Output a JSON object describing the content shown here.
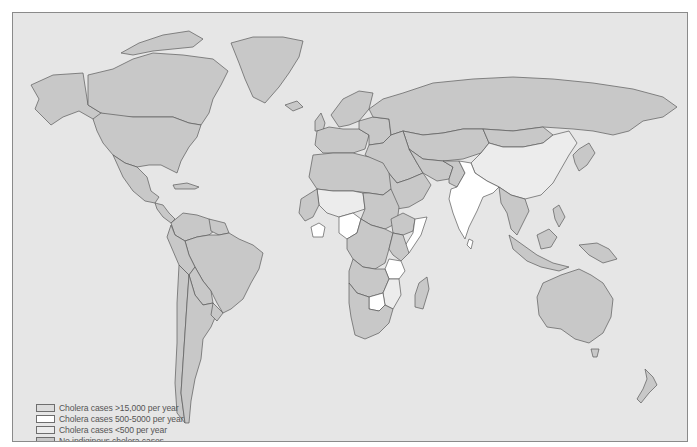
{
  "map": {
    "colors": {
      "ocean": "#e6e6e6",
      "high": "#dcdcdc",
      "mid": "#ffffff",
      "low": "#ececec",
      "none": "#c8c8c8",
      "outline": "#5a5a5a",
      "frame": "#8a8a8a"
    },
    "regions": [
      {
        "name": "alaska",
        "cls": "none",
        "d": "M18,72 L40,62 L70,60 L75,92 L88,100 L92,110 L80,106 L66,98 L50,104 L38,112 L30,104 L22,96 L26,86 Z"
      },
      {
        "name": "canada",
        "cls": "none",
        "d": "M75,92 L75,62 L100,56 L120,46 L140,40 L170,42 L200,46 L215,58 L208,72 L200,86 L196,100 L188,112 L176,110 L160,104 L120,104 L100,104 L88,100 Z"
      },
      {
        "name": "canada-arctic-islands",
        "cls": "none",
        "d": "M108,40 L126,30 L150,22 L176,18 L190,26 L180,34 L160,36 L140,38 L120,42 Z"
      },
      {
        "name": "greenland",
        "cls": "none",
        "d": "M218,30 L240,24 L270,24 L290,28 L286,44 L276,60 L266,74 L252,90 L240,84 L232,66 L226,50 Z"
      },
      {
        "name": "usa",
        "cls": "none",
        "d": "M80,106 L88,100 L120,104 L160,104 L176,110 L188,112 L184,124 L176,134 L168,148 L164,160 L156,156 L148,152 L136,152 L124,154 L112,150 L100,142 L90,130 L84,118 Z"
      },
      {
        "name": "mexico",
        "cls": "none",
        "d": "M100,142 L112,150 L124,154 L134,164 L138,178 L146,184 L142,190 L132,188 L120,178 L110,164 Z"
      },
      {
        "name": "central-america",
        "cls": "none",
        "d": "M142,190 L150,192 L156,200 L162,206 L158,210 L150,204 L144,196 Z"
      },
      {
        "name": "caribbean",
        "cls": "none",
        "d": "M160,172 L174,170 L186,174 L182,176 L170,176 L162,176 Z"
      },
      {
        "name": "colombia-venezuela",
        "cls": "none",
        "d": "M158,210 L170,200 L184,202 L196,206 L206,214 L196,222 L184,224 L172,228 L162,222 Z"
      },
      {
        "name": "guianas",
        "cls": "none",
        "d": "M196,206 L212,210 L216,220 L206,222 L198,218 Z"
      },
      {
        "name": "brazil",
        "cls": "none",
        "d": "M172,228 L184,224 L196,222 L206,222 L216,220 L226,226 L240,232 L250,240 L246,256 L238,270 L230,286 L218,296 L210,300 L204,290 L198,278 L190,268 L182,254 L176,242 Z"
      },
      {
        "name": "peru-ecuador",
        "cls": "none",
        "d": "M158,212 L162,222 L172,228 L176,242 L182,254 L176,262 L166,252 L160,238 L154,224 Z"
      },
      {
        "name": "bolivia-paraguay",
        "cls": "none",
        "d": "M176,262 L182,254 L190,268 L198,278 L200,290 L190,292 L182,282 Z"
      },
      {
        "name": "chile",
        "cls": "none",
        "d": "M166,252 L176,262 L174,290 L172,320 L170,350 L168,380 L172,410 L164,400 L162,370 L164,330 L164,290 Z"
      },
      {
        "name": "argentina",
        "cls": "none",
        "d": "M176,262 L182,282 L190,292 L200,290 L204,300 L198,314 L190,326 L188,346 L182,366 L178,388 L176,410 L172,410 L168,380 L170,350 L172,320 L174,290 Z"
      },
      {
        "name": "uruguay",
        "cls": "none",
        "d": "M200,290 L210,300 L204,308 L198,302 Z"
      },
      {
        "name": "iceland",
        "cls": "none",
        "d": "M272,92 L284,88 L290,94 L280,98 Z"
      },
      {
        "name": "uk",
        "cls": "none",
        "d": "M302,108 L308,100 L312,110 L310,118 L302,118 Z"
      },
      {
        "name": "scandinavia",
        "cls": "none",
        "d": "M318,102 L330,86 L346,78 L360,80 L356,96 L346,108 L336,112 L326,114 Z"
      },
      {
        "name": "western-europe",
        "cls": "none",
        "d": "M304,118 L316,114 L330,116 L346,116 L356,122 L352,136 L340,140 L326,140 L310,140 L302,132 Z"
      },
      {
        "name": "eastern-europe",
        "cls": "none",
        "d": "M346,108 L360,104 L376,106 L378,122 L370,130 L356,132 L356,122 L346,116 Z"
      },
      {
        "name": "russia",
        "cls": "none",
        "d": "M356,96 L370,86 L390,80 L420,70 L460,66 L500,64 L540,66 L580,70 L620,76 L650,84 L664,94 L650,104 L630,108 L616,118 L600,122 L580,118 L560,116 L530,114 L500,118 L470,116 L450,116 L430,120 L410,122 L390,118 L378,122 L376,106 L360,104 Z"
      },
      {
        "name": "kazakhstan-central-asia",
        "cls": "none",
        "d": "M390,118 L410,122 L430,120 L450,116 L470,116 L476,130 L468,140 L450,146 L430,148 L410,146 L396,136 Z"
      },
      {
        "name": "mongolia",
        "cls": "none",
        "d": "M470,116 L500,118 L530,114 L540,122 L530,130 L510,134 L490,134 L476,130 Z"
      },
      {
        "name": "china",
        "cls": "low",
        "d": "M468,140 L476,130 L490,134 L510,134 L530,130 L540,122 L556,118 L564,130 L556,142 L548,156 L540,170 L528,182 L512,186 L498,182 L486,174 L474,168 L462,160 L458,150 Z"
      },
      {
        "name": "korea-japan",
        "cls": "none",
        "d": "M560,142 L566,136 L576,130 L582,140 L574,152 L566,158 L562,150 Z"
      },
      {
        "name": "turkey-middle-east",
        "cls": "none",
        "d": "M356,132 L370,130 L378,122 L390,118 L396,136 L404,150 L410,160 L396,166 L384,170 L374,158 L362,148 L352,142 Z"
      },
      {
        "name": "iran-afghanistan",
        "cls": "none",
        "d": "M396,136 L410,146 L430,148 L440,154 L436,166 L424,168 L410,160 L404,150 Z"
      },
      {
        "name": "pakistan",
        "cls": "none",
        "d": "M430,148 L446,148 L452,160 L444,174 L436,170 L436,166 L440,154 Z"
      },
      {
        "name": "arabia",
        "cls": "none",
        "d": "M374,158 L384,170 L396,166 L410,160 L418,172 L410,186 L396,194 L384,196 L376,182 Z"
      },
      {
        "name": "india",
        "cls": "mid",
        "d": "M446,148 L458,150 L462,160 L474,168 L486,174 L480,180 L470,184 L464,198 L456,214 L452,226 L446,216 L440,200 L436,186 L438,176 L444,174 L452,160 Z"
      },
      {
        "name": "sri-lanka",
        "cls": "mid",
        "d": "M456,226 L460,228 L458,236 L454,232 Z"
      },
      {
        "name": "southeast-asia",
        "cls": "none",
        "d": "M486,174 L498,182 L512,186 L516,198 L510,210 L504,222 L498,216 L494,200 L488,190 Z"
      },
      {
        "name": "malaysia-indonesia",
        "cls": "none",
        "d": "M496,222 L510,232 L524,242 L540,250 L556,254 L546,258 L528,254 L514,248 L500,236 Z"
      },
      {
        "name": "borneo",
        "cls": "none",
        "d": "M524,222 L536,216 L544,224 L538,234 L528,236 Z"
      },
      {
        "name": "philippines",
        "cls": "none",
        "d": "M540,196 L546,192 L552,204 L546,214 L542,206 Z"
      },
      {
        "name": "new-guinea",
        "cls": "none",
        "d": "M566,232 L584,230 L596,236 L604,246 L590,250 L576,242 Z"
      },
      {
        "name": "australia",
        "cls": "none",
        "d": "M530,270 L548,262 L566,256 L578,262 L590,270 L600,286 L598,304 L590,320 L576,330 L562,326 L548,316 L534,314 L526,302 L524,284 Z"
      },
      {
        "name": "tasmania",
        "cls": "none",
        "d": "M578,336 L586,336 L584,344 L580,344 Z"
      },
      {
        "name": "new-zealand",
        "cls": "none",
        "d": "M632,356 L640,364 L644,372 L636,380 L628,390 L624,386 L630,376 L634,366 Z"
      },
      {
        "name": "north-africa",
        "cls": "none",
        "d": "M300,142 L320,140 L340,140 L356,144 L370,150 L376,160 L378,176 L370,182 L356,180 L340,178 L320,178 L304,176 L296,164 Z"
      },
      {
        "name": "mali-niger",
        "cls": "low",
        "d": "M304,176 L320,178 L340,178 L350,180 L352,196 L340,200 L326,204 L314,200 L306,192 Z"
      },
      {
        "name": "west-coast",
        "cls": "none",
        "d": "M288,186 L304,176 L306,192 L300,204 L292,208 L286,200 Z"
      },
      {
        "name": "ghana-west-africa",
        "cls": "mid",
        "d": "M298,214 L306,210 L312,214 L310,224 L300,224 Z"
      },
      {
        "name": "nigeria",
        "cls": "mid",
        "d": "M326,204 L340,200 L348,206 L344,220 L334,226 L326,220 Z"
      },
      {
        "name": "sudan-chad",
        "cls": "none",
        "d": "M350,180 L356,180 L370,182 L378,176 L386,194 L384,210 L372,216 L358,212 L348,206 L352,196 Z"
      },
      {
        "name": "ethiopia",
        "cls": "none",
        "d": "M378,206 L390,200 L402,206 L400,218 L390,222 L380,220 Z"
      },
      {
        "name": "somalia",
        "cls": "mid",
        "d": "M402,206 L414,204 L408,222 L396,240 L390,236 L400,220 Z"
      },
      {
        "name": "central-africa",
        "cls": "none",
        "d": "M334,226 L344,220 L348,206 L358,212 L372,216 L380,220 L376,236 L372,250 L362,256 L350,254 L340,246 L334,236 Z"
      },
      {
        "name": "kenya",
        "cls": "none",
        "d": "M380,220 L390,222 L396,240 L388,248 L380,242 L376,236 Z"
      },
      {
        "name": "tanzania",
        "cls": "mid",
        "d": "M376,246 L388,248 L392,258 L386,266 L376,266 L372,256 Z"
      },
      {
        "name": "angola-zambia",
        "cls": "none",
        "d": "M340,246 L350,254 L362,256 L372,256 L376,266 L370,280 L356,284 L344,280 L336,270 L336,258 Z"
      },
      {
        "name": "malawi-mozambique",
        "cls": "low",
        "d": "M376,266 L386,266 L388,282 L380,296 L372,292 L370,280 Z"
      },
      {
        "name": "zimbabwe",
        "cls": "mid",
        "d": "M356,284 L370,280 L372,292 L366,298 L356,296 Z"
      },
      {
        "name": "south-africa",
        "cls": "none",
        "d": "M336,270 L344,280 L356,284 L356,296 L366,298 L372,292 L380,296 L376,310 L366,320 L352,326 L342,322 L338,304 L336,290 Z"
      },
      {
        "name": "madagascar",
        "cls": "none",
        "d": "M406,270 L414,264 L416,276 L410,296 L402,294 L402,282 Z"
      }
    ]
  },
  "legend": {
    "items": [
      {
        "label": "Cholera cases >15,000 per year",
        "swatch": "#dcdcdc"
      },
      {
        "label": "Cholera cases 500-5000 per year",
        "swatch": "#ffffff"
      },
      {
        "label": "Cholera cases <500 per year",
        "swatch": "#ececec"
      },
      {
        "label": "No indiginous cholera cases",
        "swatch": "#c8c8c8"
      }
    ]
  }
}
